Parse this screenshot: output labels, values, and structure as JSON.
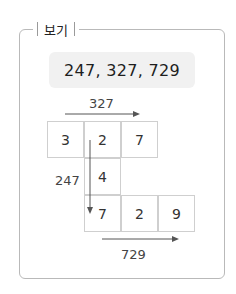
{
  "label": "보기",
  "numbers": "247, 327, 729",
  "diagram": {
    "top_label": "327",
    "left_label": "247",
    "bottom_label": "729",
    "row1": [
      "3",
      "2",
      "7"
    ],
    "middle": "4",
    "row3": [
      "7",
      "2",
      "9"
    ]
  }
}
